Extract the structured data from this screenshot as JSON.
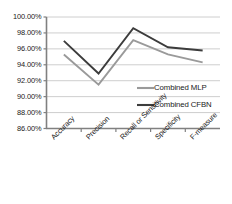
{
  "chart_data": {
    "type": "line",
    "title": "",
    "xlabel": "",
    "ylabel": "",
    "categories": [
      "Accuracy",
      "Precision",
      "Recall or Sensitivity",
      "Specificity",
      "F-measure"
    ],
    "series": [
      {
        "name": "Combined MLP",
        "color": "#9a9a9a",
        "values": [
          95.3,
          91.5,
          97.1,
          95.3,
          94.3
        ]
      },
      {
        "name": "Combined CFBN",
        "color": "#3c3c3c",
        "values": [
          97.0,
          92.9,
          98.6,
          96.2,
          95.8
        ]
      }
    ],
    "ylim": [
      86,
      100
    ],
    "ystep": 2,
    "ytick_labels": [
      "100.00%",
      "98.00%",
      "96.00%",
      "94.00%",
      "92.00%",
      "90.00%",
      "88.00%",
      "86.00%"
    ],
    "ytick_values": [
      100,
      98,
      96,
      94,
      92,
      90,
      88,
      86
    ],
    "grid": true,
    "legend_position": "inside-right-middle",
    "axis_color": "#808080",
    "grid_color": "#c8c8c8",
    "background": "#ffffff"
  }
}
